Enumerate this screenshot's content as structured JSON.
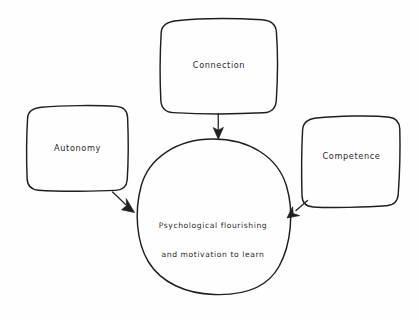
{
  "diagram": {
    "background_color": "#fefefe",
    "stroke_color": "#1f1f1f",
    "style": "hand-drawn sketch",
    "nodes": [
      {
        "id": "connection",
        "label": "Connection",
        "shape": "rounded-rectangle",
        "role": "need"
      },
      {
        "id": "autonomy",
        "label": "Autonomy",
        "shape": "rounded-rectangle",
        "role": "need"
      },
      {
        "id": "competence",
        "label": "Competence",
        "shape": "rounded-rectangle",
        "role": "need"
      },
      {
        "id": "outcome",
        "label_line1": "Psychological flourishing",
        "label_line2": "and motivation to learn",
        "shape": "circle",
        "role": "outcome"
      }
    ],
    "edges": [
      {
        "id": "connection-to-outcome",
        "from": "connection",
        "to": "outcome",
        "direction": "down",
        "arrowhead": "filled-triangle"
      },
      {
        "id": "autonomy-to-outcome",
        "from": "autonomy",
        "to": "outcome",
        "direction": "down-right",
        "arrowhead": "filled-triangle"
      },
      {
        "id": "competence-to-outcome",
        "from": "competence",
        "to": "outcome",
        "direction": "down-left",
        "arrowhead": "filled-triangle"
      }
    ]
  }
}
